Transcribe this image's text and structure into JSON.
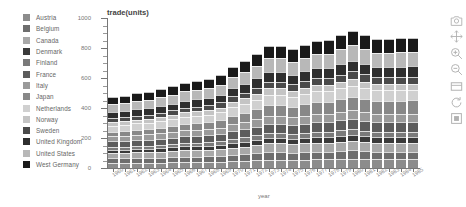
{
  "chart_data": {
    "type": "bar",
    "barmode": "stacked",
    "title": "trade(units)",
    "xlabel": "year",
    "ylabel": "",
    "ylim": [
      0,
      1000
    ],
    "yticks": [
      0,
      200,
      400,
      600,
      800,
      1000
    ],
    "grid": false,
    "legend_position": "left-outside",
    "categories": [
      "1960",
      "1961",
      "1962",
      "1963",
      "1964",
      "1965",
      "1966",
      "1967",
      "1968",
      "1969",
      "1970",
      "1971",
      "1972",
      "1973",
      "1974",
      "1975",
      "1976",
      "1977",
      "1978",
      "1979",
      "1980",
      "1981",
      "1982",
      "1983",
      "1984",
      "1985"
    ],
    "series": [
      {
        "name": "Austria",
        "color": "#8c8c8c",
        "values": [
          34,
          34,
          35,
          36,
          36,
          38,
          40,
          40,
          40,
          42,
          46,
          48,
          52,
          56,
          56,
          54,
          56,
          58,
          58,
          60,
          62,
          60,
          58,
          58,
          58,
          58
        ]
      },
      {
        "name": "Belgium",
        "color": "#6e6e6e",
        "values": [
          30,
          31,
          32,
          32,
          33,
          34,
          36,
          36,
          37,
          38,
          42,
          44,
          46,
          50,
          50,
          48,
          50,
          52,
          52,
          54,
          55,
          53,
          52,
          52,
          52,
          52
        ]
      },
      {
        "name": "Canada",
        "color": "#a8a8a8",
        "values": [
          36,
          36,
          37,
          38,
          39,
          40,
          42,
          42,
          43,
          45,
          48,
          50,
          54,
          58,
          58,
          56,
          58,
          60,
          60,
          62,
          64,
          62,
          60,
          60,
          60,
          60
        ]
      },
      {
        "name": "Denmark",
        "color": "#3a3a3a",
        "values": [
          22,
          22,
          23,
          23,
          24,
          25,
          26,
          26,
          27,
          28,
          30,
          32,
          34,
          36,
          36,
          35,
          36,
          38,
          38,
          39,
          40,
          39,
          38,
          38,
          38,
          38
        ]
      },
      {
        "name": "Finland",
        "color": "#7a7a7a",
        "values": [
          20,
          20,
          21,
          21,
          22,
          23,
          24,
          24,
          25,
          26,
          28,
          30,
          32,
          34,
          34,
          33,
          34,
          35,
          35,
          36,
          38,
          36,
          35,
          35,
          35,
          35
        ]
      },
      {
        "name": "France",
        "color": "#5c5c5c",
        "values": [
          38,
          38,
          40,
          40,
          42,
          43,
          45,
          46,
          46,
          48,
          52,
          55,
          58,
          62,
          62,
          60,
          62,
          64,
          64,
          66,
          68,
          66,
          64,
          64,
          64,
          64
        ]
      },
      {
        "name": "Italy",
        "color": "#9a9a9a",
        "values": [
          32,
          33,
          34,
          34,
          36,
          37,
          38,
          39,
          40,
          41,
          45,
          47,
          50,
          54,
          54,
          52,
          54,
          56,
          56,
          58,
          60,
          58,
          56,
          56,
          56,
          56
        ]
      },
      {
        "name": "Japan",
        "color": "#888888",
        "values": [
          30,
          32,
          34,
          36,
          38,
          41,
          44,
          46,
          48,
          52,
          58,
          62,
          66,
          72,
          72,
          70,
          74,
          78,
          80,
          84,
          88,
          86,
          84,
          84,
          86,
          88
        ]
      },
      {
        "name": "Netherlands",
        "color": "#d0d0d0",
        "values": [
          40,
          41,
          42,
          43,
          45,
          46,
          48,
          49,
          50,
          52,
          57,
          60,
          64,
          68,
          68,
          66,
          68,
          70,
          70,
          72,
          74,
          72,
          70,
          70,
          70,
          70
        ]
      },
      {
        "name": "Norway",
        "color": "#c4c4c4",
        "values": [
          24,
          24,
          25,
          25,
          26,
          27,
          28,
          29,
          30,
          31,
          34,
          36,
          38,
          41,
          41,
          40,
          41,
          42,
          42,
          44,
          45,
          44,
          42,
          42,
          42,
          42
        ]
      },
      {
        "name": "Sweden",
        "color": "#4a4a4a",
        "values": [
          26,
          26,
          27,
          28,
          29,
          30,
          31,
          32,
          33,
          34,
          37,
          39,
          42,
          45,
          45,
          44,
          45,
          46,
          46,
          48,
          50,
          48,
          46,
          46,
          46,
          46
        ]
      },
      {
        "name": "United Kingdom",
        "color": "#2e2e2e",
        "values": [
          42,
          42,
          43,
          44,
          45,
          46,
          48,
          48,
          49,
          51,
          55,
          58,
          62,
          66,
          66,
          64,
          66,
          68,
          68,
          70,
          72,
          70,
          68,
          68,
          68,
          68
        ]
      },
      {
        "name": "United States",
        "color": "#b8b8b8",
        "values": [
          52,
          53,
          55,
          56,
          58,
          60,
          62,
          63,
          65,
          68,
          74,
          78,
          84,
          90,
          90,
          88,
          90,
          94,
          94,
          98,
          102,
          98,
          95,
          95,
          96,
          96
        ]
      },
      {
        "name": "West Germany",
        "color": "#1a1a1a",
        "values": [
          46,
          47,
          49,
          50,
          52,
          54,
          56,
          58,
          60,
          63,
          68,
          72,
          78,
          84,
          84,
          82,
          85,
          88,
          90,
          94,
          98,
          95,
          92,
          92,
          94,
          96
        ]
      }
    ]
  },
  "legend": {
    "items": [
      {
        "label": "Austria"
      },
      {
        "label": "Belgium"
      },
      {
        "label": "Canada"
      },
      {
        "label": "Denmark"
      },
      {
        "label": "Finland"
      },
      {
        "label": "France"
      },
      {
        "label": "Italy"
      },
      {
        "label": "Japan"
      },
      {
        "label": "Netherlands"
      },
      {
        "label": "Norway"
      },
      {
        "label": "Sweden"
      },
      {
        "label": "United Kingdom"
      },
      {
        "label": "United States"
      },
      {
        "label": "West Germany"
      }
    ]
  },
  "modebar": {
    "buttons": [
      {
        "name": "camera-icon",
        "title": "Download plot as a png"
      },
      {
        "name": "pan-icon",
        "title": "Pan"
      },
      {
        "name": "zoom-in-icon",
        "title": "Zoom in"
      },
      {
        "name": "zoom-out-icon",
        "title": "Zoom out"
      },
      {
        "name": "autoscale-icon",
        "title": "Autoscale"
      },
      {
        "name": "reset-axes-icon",
        "title": "Reset axes"
      },
      {
        "name": "home-icon",
        "title": "Reset"
      }
    ]
  }
}
